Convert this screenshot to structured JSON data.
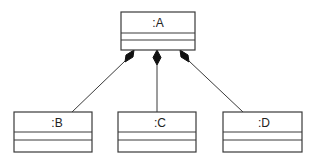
{
  "diagram": {
    "type": "UML object diagram (composition)",
    "stroke_color": "#3a3a3a",
    "fill_color": "#ffffff",
    "parent": {
      "label": ":A"
    },
    "children": [
      {
        "label": ":B"
      },
      {
        "label": ":C"
      },
      {
        "label": ":D"
      }
    ],
    "relationship": "composition"
  }
}
